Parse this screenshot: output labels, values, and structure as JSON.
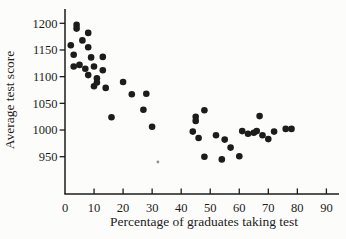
{
  "figure": {
    "background": "#fcfcfa",
    "ink": "#1c1c1c"
  },
  "chart_data": {
    "type": "scatter",
    "title": "",
    "xlabel": "Percentage of graduates taking test",
    "ylabel": "Average test score",
    "xlim": [
      0,
      94
    ],
    "ylim": [
      880,
      1228
    ],
    "xticks": [
      0,
      10,
      20,
      30,
      40,
      50,
      60,
      70,
      80,
      90
    ],
    "yticks": [
      950,
      1000,
      1050,
      1100,
      1150,
      1200
    ],
    "grid": false,
    "legend_position": "none",
    "marker": {
      "shape": "circle",
      "color": "#1c1c1c",
      "radius_px": 3.3
    },
    "points": [
      [
        4,
        1197
      ],
      [
        4,
        1190
      ],
      [
        8,
        1182
      ],
      [
        6,
        1168
      ],
      [
        2,
        1159
      ],
      [
        8,
        1155
      ],
      [
        3,
        1141
      ],
      [
        9,
        1136
      ],
      [
        13,
        1137
      ],
      [
        3,
        1119
      ],
      [
        5,
        1122
      ],
      [
        10,
        1119
      ],
      [
        7,
        1115
      ],
      [
        13,
        1112
      ],
      [
        8,
        1103
      ],
      [
        11,
        1097
      ],
      [
        11,
        1089
      ],
      [
        10,
        1082
      ],
      [
        14,
        1079
      ],
      [
        20,
        1090
      ],
      [
        23,
        1067
      ],
      [
        28,
        1068
      ],
      [
        27,
        1038
      ],
      [
        16,
        1024
      ],
      [
        30,
        1006
      ],
      [
        44,
        997
      ],
      [
        46,
        985
      ],
      [
        52,
        990
      ],
      [
        55,
        982
      ],
      [
        57,
        967
      ],
      [
        48,
        950
      ],
      [
        54,
        945
      ],
      [
        60,
        951
      ],
      [
        45,
        1025
      ],
      [
        45,
        1017
      ],
      [
        48,
        1037
      ],
      [
        67,
        1026
      ],
      [
        61,
        998
      ],
      [
        63,
        993
      ],
      [
        65,
        995
      ],
      [
        66,
        998
      ],
      [
        68,
        990
      ],
      [
        70,
        983
      ],
      [
        72,
        997
      ],
      [
        76,
        1002
      ],
      [
        78,
        1002
      ]
    ],
    "stray_mark": {
      "x": 32,
      "y": 940,
      "color": "#909090",
      "radius_px": 1.4
    }
  }
}
